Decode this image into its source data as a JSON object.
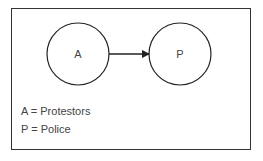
{
  "diagram": {
    "nodes": [
      {
        "id": "A",
        "label": "A",
        "cx": 78,
        "cy": 54,
        "r": 31
      },
      {
        "id": "P",
        "label": "P",
        "cx": 180,
        "cy": 54,
        "r": 31
      }
    ],
    "edges": [
      {
        "from": "A",
        "to": "P",
        "directed": true
      }
    ],
    "legend": [
      {
        "text": "A = Protestors"
      },
      {
        "text": "P = Police"
      }
    ]
  }
}
